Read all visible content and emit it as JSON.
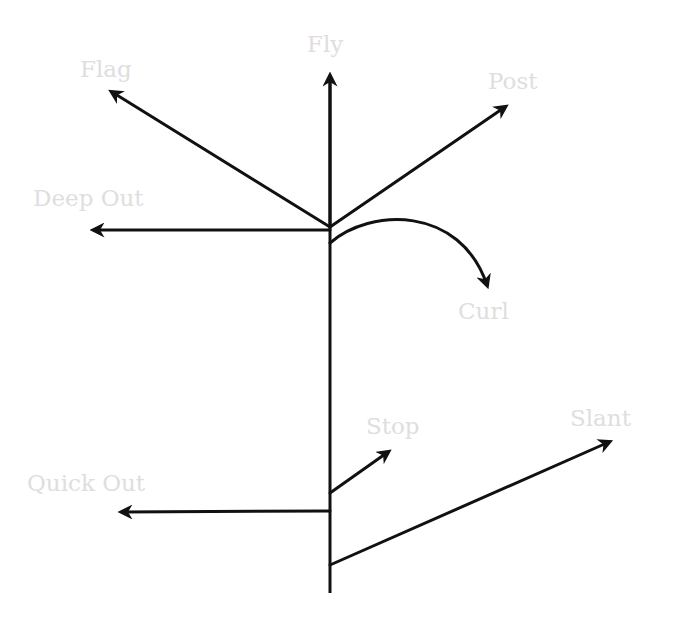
{
  "diagram": {
    "colors": {
      "line": "#111111",
      "label": "#dedede",
      "background": "#ffffff"
    },
    "stem": {
      "x": 330,
      "y_top": 75,
      "y_bottom": 593
    },
    "routes": [
      {
        "id": "fly",
        "label": "Fly",
        "from": [
          330,
          227
        ],
        "to": [
          330,
          74
        ],
        "label_pos": [
          307,
          33
        ]
      },
      {
        "id": "flag",
        "label": "Flag",
        "from": [
          330,
          227
        ],
        "to": [
          110,
          91
        ],
        "label_pos": [
          80,
          58
        ]
      },
      {
        "id": "post",
        "label": "Post",
        "from": [
          330,
          227
        ],
        "to": [
          507,
          106
        ],
        "label_pos": [
          488,
          70
        ]
      },
      {
        "id": "deep-out",
        "label": "Deep Out",
        "from": [
          330,
          230
        ],
        "to": [
          92,
          230
        ],
        "label_pos": [
          33,
          187
        ]
      },
      {
        "id": "curl",
        "label": "Curl",
        "from": [
          330,
          243
        ],
        "to": [
          487,
          287
        ],
        "label_pos": [
          458,
          300
        ]
      },
      {
        "id": "stop",
        "label": "Stop",
        "from": [
          330,
          493
        ],
        "to": [
          390,
          451
        ],
        "label_pos": [
          366,
          415
        ]
      },
      {
        "id": "quick-out",
        "label": "Quick Out",
        "from": [
          330,
          511
        ],
        "to": [
          120,
          512
        ],
        "label_pos": [
          27,
          472
        ]
      },
      {
        "id": "slant",
        "label": "Slant",
        "from": [
          330,
          565
        ],
        "to": [
          611,
          441
        ],
        "label_pos": [
          570,
          407
        ]
      }
    ]
  }
}
